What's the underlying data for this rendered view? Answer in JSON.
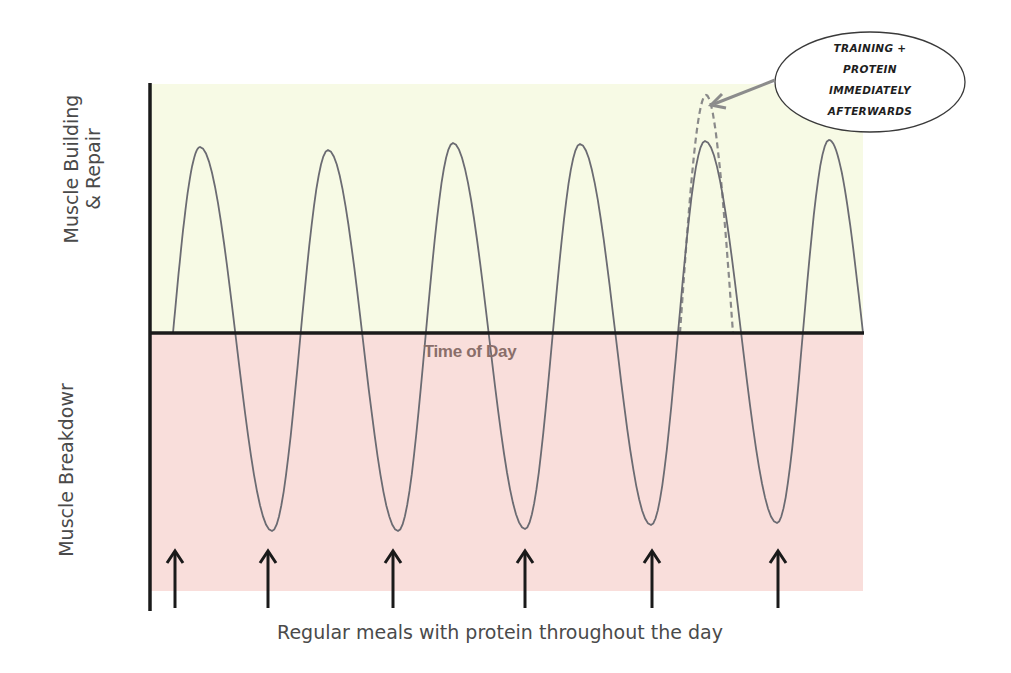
{
  "diagram": {
    "y_axis_labels": {
      "top_line1": "Muscle Building",
      "top_line2": "& Repair",
      "bottom": "Muscle Breakdowr"
    },
    "x_axis_label": "Time of Day",
    "caption": "Regular meals with protein throughout the day",
    "callout": {
      "lines": [
        "TRAINING +",
        "PROTEIN",
        "IMMEDIATELY",
        "AFTERWARDS"
      ]
    },
    "colors": {
      "building_zone": "#F7FAE5",
      "breakdown_zone": "#F9DEDB",
      "axis": "#1a1a1a",
      "curve": "#6b6b72",
      "dashed_curve": "#8a8a8a",
      "arrow": "#1a1a1a",
      "callout_arrow": "#8c8c8c"
    }
  },
  "chart_data": {
    "type": "line",
    "title": "",
    "xlabel": "Time of Day",
    "ylabel_positive": "Muscle Building & Repair",
    "ylabel_negative": "Muscle Breakdown",
    "caption": "Regular meals with protein throughout the day",
    "series": [
      {
        "name": "Muscle protein balance",
        "style": "solid",
        "description": "Oscillating curve: peaks after each meal, troughs before next meal",
        "peaks_x_px": [
          200,
          328,
          453,
          580,
          705,
          829
        ],
        "troughs_x_px": [
          272,
          398,
          525,
          651,
          777
        ],
        "peak_level": 1.0,
        "trough_level": -1.0
      },
      {
        "name": "Training + protein immediately afterwards",
        "style": "dashed",
        "description": "Higher peak at 5th cycle",
        "peak_x_px": 706,
        "peak_level": 1.24
      }
    ],
    "meal_markers_x_px": [
      175,
      268,
      393,
      525,
      652,
      778
    ],
    "annotations": [
      {
        "text": "TRAINING + PROTEIN IMMEDIATELY AFTERWARDS",
        "points_to": "dashed peak at 5th cycle"
      }
    ],
    "grid": false,
    "legend": "none"
  }
}
